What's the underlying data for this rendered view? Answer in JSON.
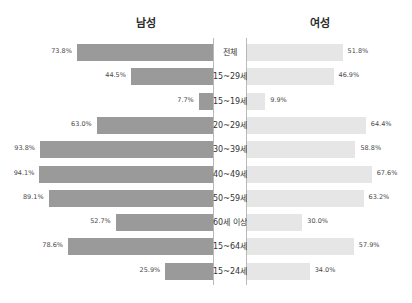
{
  "chart_data": {
    "type": "bar",
    "title": "",
    "subtitle": "",
    "orientation": "horizontal-diverging",
    "xlabel": "",
    "ylabel": "",
    "unit": "%",
    "xlim": [
      0,
      100
    ],
    "grid": false,
    "legend_position": "top",
    "categories": [
      "전체",
      "15~29세",
      "15~19세",
      "20~29세",
      "30~39세",
      "40~49세",
      "50~59세",
      "60세 이상",
      "15~64세",
      "15~24세"
    ],
    "series": [
      {
        "name": "남성",
        "side": "left",
        "color": "#9a9a9a",
        "values": [
          73.8,
          44.5,
          7.7,
          63.0,
          93.8,
          94.1,
          89.1,
          52.7,
          78.6,
          25.9
        ],
        "labels": [
          "73.8%",
          "44.5%",
          "7.7%",
          "63.0%",
          "93.8%",
          "94.1%",
          "89.1%",
          "52.7%",
          "78.6%",
          "25.9%"
        ]
      },
      {
        "name": "여성",
        "side": "right",
        "color": "#e6e6e6",
        "values": [
          51.8,
          46.9,
          9.9,
          64.4,
          58.8,
          67.6,
          63.2,
          30.0,
          57.9,
          34.0
        ],
        "labels": [
          "51.8%",
          "46.9%",
          "9.9%",
          "64.4%",
          "58.8%",
          "67.6%",
          "63.2%",
          "30.0%",
          "57.9%",
          "34.0%"
        ]
      }
    ]
  },
  "headers": {
    "male": "남성",
    "female": "여성"
  },
  "rows": [
    {
      "label": "전체",
      "male_value": "73.8%",
      "female_value": "51.8%"
    },
    {
      "label": "15~29세",
      "male_value": "44.5%",
      "female_value": "46.9%"
    },
    {
      "label": "15~19세",
      "male_value": "7.7%",
      "female_value": "9.9%"
    },
    {
      "label": "20~29세",
      "male_value": "63.0%",
      "female_value": "64.4%"
    },
    {
      "label": "30~39세",
      "male_value": "93.8%",
      "female_value": "58.8%"
    },
    {
      "label": "40~49세",
      "male_value": "94.1%",
      "female_value": "67.6%"
    },
    {
      "label": "50~59세",
      "male_value": "89.1%",
      "female_value": "63.2%"
    },
    {
      "label": "60세 이상",
      "male_value": "52.7%",
      "female_value": "30.0%"
    },
    {
      "label": "15~64세",
      "male_value": "78.6%",
      "female_value": "57.9%"
    },
    {
      "label": "15~24세",
      "male_value": "25.9%",
      "female_value": "34.0%"
    }
  ],
  "colors": {
    "male_bar": "#9a9a9a",
    "female_bar": "#e6e6e6",
    "axis": "#b8b8b8",
    "background": "#ffffff",
    "text": "#3a3a3a"
  }
}
